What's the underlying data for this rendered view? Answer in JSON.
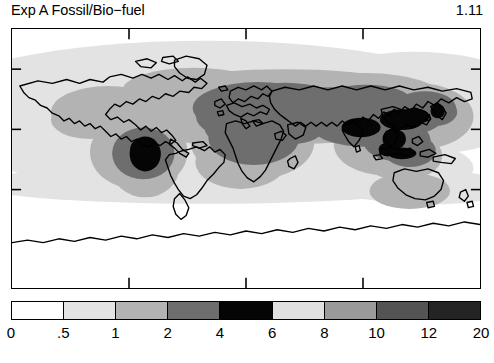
{
  "header": {
    "title": "Exp A Fossil/Bio−fuel",
    "value": "1.11"
  },
  "map": {
    "projection": "cylindrical-equidistant",
    "frame_border_color": "#000000",
    "background": "#ffffff",
    "axis_ticks": {
      "top": [
        "",
        "",
        ""
      ],
      "left": [
        "",
        "",
        ""
      ]
    }
  },
  "colorbar": {
    "orientation": "horizontal",
    "labels": [
      "0",
      ".5",
      "1",
      "2",
      "4",
      "6",
      "8",
      "10",
      "12",
      "20"
    ],
    "segments": [
      {
        "from": "0",
        "to": ".5",
        "color": "#ffffff"
      },
      {
        "from": ".5",
        "to": "1",
        "color": "#e3e3e3"
      },
      {
        "from": "1",
        "to": "2",
        "color": "#b3b3b3"
      },
      {
        "from": "2",
        "to": "4",
        "color": "#6e6e6e"
      },
      {
        "from": "4",
        "to": "6",
        "color": "#050505"
      },
      {
        "from": "6",
        "to": "8",
        "color": "#e0e0e0"
      },
      {
        "from": "8",
        "to": "10",
        "color": "#9a9a9a"
      },
      {
        "from": "10",
        "to": "12",
        "color": "#545454"
      },
      {
        "from": "12",
        "to": "20",
        "color": "#242424"
      }
    ]
  },
  "chart_data": {
    "type": "heatmap",
    "title": "Exp A Fossil/Bio−fuel",
    "annotation": "1.11",
    "xlabel": "",
    "ylabel": "",
    "xlim": [
      -180,
      180
    ],
    "ylim": [
      -90,
      90
    ],
    "grid": false,
    "legend": "colorbar-below",
    "colorbar_levels": [
      0,
      0.5,
      1,
      2,
      4,
      6,
      8,
      10,
      12,
      20
    ],
    "colorbar_colors": [
      "#ffffff",
      "#e3e3e3",
      "#b3b3b3",
      "#6e6e6e",
      "#050505",
      "#e0e0e0",
      "#9a9a9a",
      "#545454",
      "#242424"
    ],
    "regions": [
      {
        "name": "eastern-north-america",
        "level_band": "1-2",
        "center": [
          -85,
          38
        ]
      },
      {
        "name": "amazon-brazil-core",
        "level_band": "4-6",
        "center": [
          -58,
          -9
        ]
      },
      {
        "name": "amazon-brazil-inner",
        "level_band": "2-4",
        "center": [
          -58,
          -9
        ]
      },
      {
        "name": "south-america-outer",
        "level_band": "1-2",
        "center": [
          -60,
          -12
        ]
      },
      {
        "name": "central-africa",
        "level_band": "2-4",
        "center": [
          18,
          5
        ]
      },
      {
        "name": "southern-africa",
        "level_band": "1-2",
        "center": [
          22,
          -15
        ]
      },
      {
        "name": "europe-western-russia",
        "level_band": "2-4",
        "center": [
          30,
          50
        ]
      },
      {
        "name": "northern-eurasia-belt",
        "level_band": "1-2",
        "center": [
          75,
          58
        ]
      },
      {
        "name": "india-subcontinent",
        "level_band": "4-6",
        "center": [
          78,
          24
        ]
      },
      {
        "name": "eastern-china",
        "level_band": "4-6",
        "center": [
          112,
          32
        ]
      },
      {
        "name": "southeast-asia",
        "level_band": "4-6",
        "center": [
          105,
          14
        ]
      },
      {
        "name": "japan-korea",
        "level_band": "2-4",
        "center": [
          135,
          37
        ]
      },
      {
        "name": "indonesia",
        "level_band": "4-6",
        "center": [
          115,
          -2
        ]
      },
      {
        "name": "southern-hemisphere-ocean-band",
        "level_band": ".5-1",
        "center": [
          0,
          -35
        ]
      },
      {
        "name": "pacific-ocean-low",
        "level_band": "0-.5",
        "center": [
          -150,
          0
        ]
      },
      {
        "name": "antarctica",
        "level_band": "0-.5",
        "center": [
          0,
          -80
        ]
      }
    ]
  }
}
